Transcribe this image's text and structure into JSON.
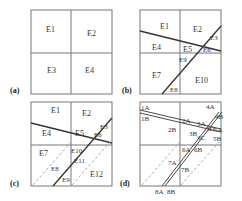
{
  "figure": {
    "colors": {
      "box": "#777777",
      "line": "#333333",
      "dashed": "#999999",
      "text": "#333333"
    },
    "panels": [
      {
        "id": "a",
        "tag": "(a)",
        "labels": [
          "E1",
          "E2",
          "E3",
          "E4"
        ]
      },
      {
        "id": "b",
        "tag": "(b)",
        "labels": [
          "E1",
          "E2",
          "E3",
          "E4",
          "E5",
          "E6",
          "E7",
          "E8",
          "E9",
          "E10"
        ]
      },
      {
        "id": "c",
        "tag": "(c)",
        "labels": [
          "E1",
          "E2",
          "E3",
          "E4",
          "E5",
          "E6",
          "E7",
          "E8",
          "E9",
          "E10",
          "E11",
          "E12"
        ]
      },
      {
        "id": "d",
        "tag": "(d)",
        "labels": [
          "1A",
          "1B",
          "2A",
          "2B",
          "3A",
          "3B",
          "3C",
          "3D",
          "4A",
          "4B",
          "5A",
          "5B",
          "6A",
          "6B",
          "7A",
          "7B",
          "8A",
          "8B"
        ]
      }
    ]
  }
}
